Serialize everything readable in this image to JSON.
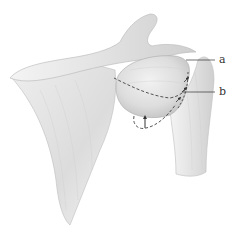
{
  "figure": {
    "labels": [
      {
        "id": "a",
        "text": "a"
      },
      {
        "id": "b",
        "text": "b"
      }
    ],
    "colors": {
      "background": "#ffffff",
      "bone_light": "#ececec",
      "bone_mid": "#d6d6d6",
      "bone_shadow": "#b9b9b9",
      "outline": "#9a9a9a",
      "dash": "#444444",
      "leader": "#333333"
    }
  }
}
